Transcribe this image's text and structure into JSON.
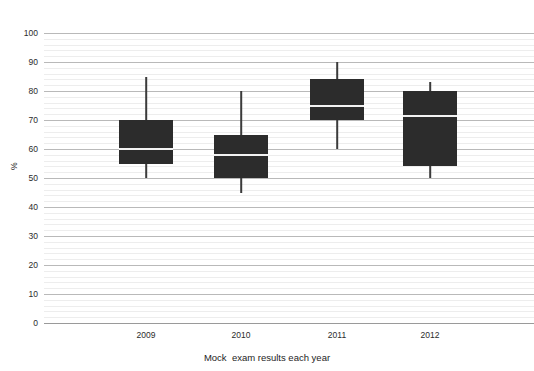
{
  "figure": {
    "cropped_top_text": "",
    "background_color": "#ffffff",
    "box_fill_color": "#2c2c2c",
    "median_color": "#f2f2f2",
    "whisker_color": "#3b3b3b",
    "major_gridline_color": "#b9b9b9",
    "minor_gridline_color": "#ededed"
  },
  "chart_data": {
    "type": "box",
    "title": "",
    "xlabel": "Mock  exam results each year",
    "ylabel": "%",
    "ylim": [
      0,
      100
    ],
    "ytick_step": 10,
    "yticks": [
      0,
      10,
      20,
      30,
      40,
      50,
      60,
      70,
      80,
      90,
      100
    ],
    "ytick_labels": [
      "0",
      "10",
      "20",
      "30",
      "40",
      "50",
      "60",
      "70",
      "80",
      "90",
      "100"
    ],
    "minor_gridline_step": 2,
    "grid": true,
    "legend": false,
    "categories": [
      "2009",
      "2010",
      "2011",
      "2012"
    ],
    "boxes": [
      {
        "category": "2009",
        "min": 50,
        "q1": 55,
        "median": 60,
        "q3": 70,
        "max": 85,
        "center_px": 102,
        "width_px": 54
      },
      {
        "category": "2010",
        "min": 45,
        "q1": 50,
        "median": 58,
        "q3": 65,
        "max": 80,
        "center_px": 197,
        "width_px": 54
      },
      {
        "category": "2011",
        "min": 60,
        "q1": 70,
        "median": 75,
        "q3": 84,
        "max": 90,
        "center_px": 293,
        "width_px": 54
      },
      {
        "category": "2012",
        "min": 50,
        "q1": 54,
        "median": 71.5,
        "q3": 80,
        "max": 83,
        "center_px": 386,
        "width_px": 54
      }
    ]
  }
}
